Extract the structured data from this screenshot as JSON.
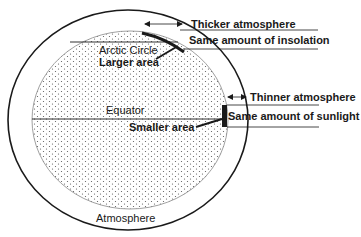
{
  "diagram": {
    "labels": {
      "thicker_atmosphere": "Thicker atmosphere",
      "same_insolation": "Same amount of insolation",
      "arctic_circle": "Arctic Circle",
      "larger_area": "Larger area",
      "equator": "Equator",
      "thinner_atmosphere": "Thinner atmosphere",
      "same_sunlight": "Same amount of sunlight",
      "smaller_area": "Smaller area",
      "atmosphere": "Atmosphere"
    },
    "colors": {
      "line": "#1a1a1a",
      "dots": "#555555",
      "background": "#ffffff"
    }
  }
}
